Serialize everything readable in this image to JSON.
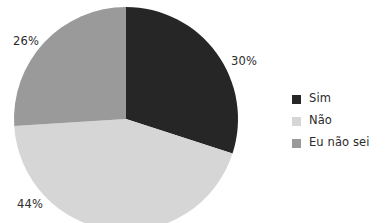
{
  "chart_data": {
    "type": "pie",
    "title": "",
    "subtitle": "",
    "xlabel": "",
    "ylabel": "",
    "grid": false,
    "legend_position": "right",
    "start_angle_deg": 0,
    "direction": "clockwise",
    "categories": [
      "Sim",
      "Não",
      "Eu não sei"
    ],
    "values": [
      30,
      44,
      26
    ],
    "value_unit": "%",
    "data_labels": [
      "30%",
      "44%",
      "26%"
    ],
    "colors": [
      "#262626",
      "#d6d6d6",
      "#9a9a9a"
    ],
    "slices": [
      {
        "label": "Sim",
        "value": 30,
        "data_label": "30%",
        "color": "#262626"
      },
      {
        "label": "Não",
        "value": 44,
        "data_label": "44%",
        "color": "#d6d6d6"
      },
      {
        "label": "Eu não sei",
        "value": 26,
        "data_label": "26%",
        "color": "#9a9a9a"
      }
    ]
  },
  "legend": {
    "items": [
      {
        "label": "Sim",
        "color": "#262626"
      },
      {
        "label": "Não",
        "color": "#d6d6d6"
      },
      {
        "label": "Eu não sei",
        "color": "#9a9a9a"
      }
    ]
  },
  "labels": {
    "sim": "30%",
    "nao": "44%",
    "eu_nao_sei": "26%"
  }
}
